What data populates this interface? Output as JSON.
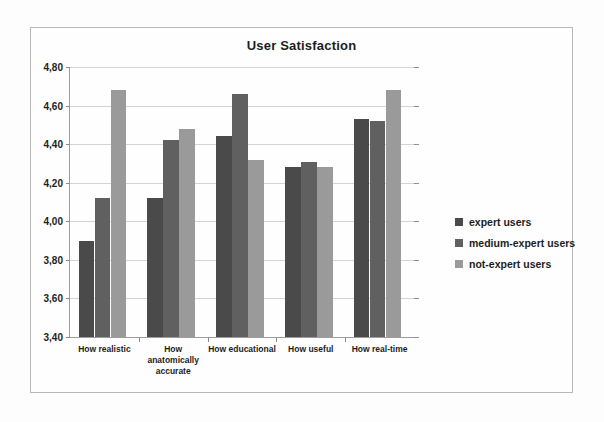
{
  "chart_data": {
    "type": "bar",
    "title": "User Satisfaction",
    "xlabel": "",
    "ylabel": "",
    "ylim": [
      3.4,
      4.8
    ],
    "ytick_step": 0.2,
    "ytick_labels": [
      "4,80",
      "4,60",
      "4,40",
      "4,20",
      "4,00",
      "3,80",
      "3,60",
      "3,40"
    ],
    "ytick_values": [
      4.8,
      4.6,
      4.4,
      4.2,
      4.0,
      3.8,
      3.6,
      3.4
    ],
    "decimal_separator": ",",
    "grid": true,
    "legend_position": "right",
    "categories": [
      "How realistic",
      "How anatomically accurate",
      "How educational",
      "How useful",
      "How real-time"
    ],
    "series": [
      {
        "name": "expert users",
        "color": "#4a4a4a",
        "values": [
          3.9,
          4.12,
          4.44,
          4.28,
          4.53
        ]
      },
      {
        "name": "medium-expert users",
        "color": "#606060",
        "values": [
          4.12,
          4.42,
          4.66,
          4.31,
          4.52
        ]
      },
      {
        "name": "not-expert users",
        "color": "#9a9a9a",
        "values": [
          4.68,
          4.48,
          4.32,
          4.28,
          4.68
        ]
      }
    ]
  },
  "colors": {
    "frame_border": "#b8b8b8",
    "axis": "#9d9d9d",
    "gridline": "#d4d4d4",
    "background": "#fdfdfd",
    "text": "#1d1d1d"
  }
}
